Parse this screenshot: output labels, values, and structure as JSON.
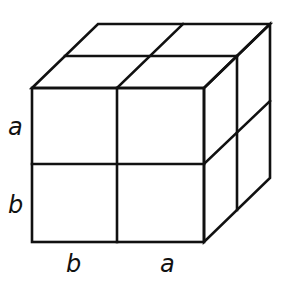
{
  "diagram": {
    "type": "cube-decomposition",
    "labels": {
      "left_upper": "a",
      "left_lower": "b",
      "bottom_left": "b",
      "bottom_right": "a"
    },
    "colors": {
      "stroke": "#111111",
      "background": "#ffffff"
    }
  }
}
